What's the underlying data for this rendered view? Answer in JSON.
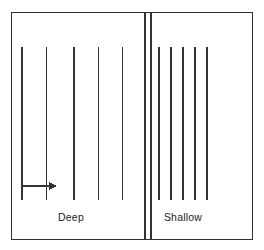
{
  "figure": {
    "background_color": "#ffffff",
    "line_color": "#333333",
    "frame": {
      "name": "outer-frame",
      "x": 11.5,
      "y": 12.5,
      "width": 241,
      "height": 227,
      "stroke_width": 1.6
    },
    "divider": {
      "name": "central-divider",
      "lines": [
        {
          "x": 145.2,
          "stroke_width": 2.2
        },
        {
          "x": 151.2,
          "stroke_width": 2.2
        }
      ],
      "y_top": 12.5,
      "y_bottom": 239.5
    },
    "panels": [
      {
        "name": "deep-panel",
        "label": "Deep",
        "label_x": 71,
        "label_y": 221,
        "label_anchor": "middle",
        "spacing": 25,
        "line_top": 47,
        "line_bottom": 200,
        "stroke_width": 1.3,
        "line_x": [
          22,
          46.5,
          74,
          98.5,
          122.5
        ]
      },
      {
        "name": "shallow-panel",
        "label": "Shallow",
        "label_x": 183,
        "label_y": 221,
        "label_anchor": "middle",
        "spacing": 12,
        "line_top": 47,
        "line_bottom": 200,
        "stroke_width": 1.3,
        "line_x": [
          159,
          171,
          183,
          195,
          207
        ]
      }
    ],
    "spacing_arrow": {
      "name": "spacing-arrow",
      "x_start": 22,
      "x_end": 57,
      "y": 186,
      "stroke_width": 1.4,
      "head_length": 8,
      "head_half_width": 4
    }
  }
}
